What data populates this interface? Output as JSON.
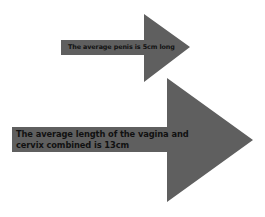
{
  "colors": {
    "background": "#ffffff",
    "arrow_fill": "#5f5f5f",
    "text": "#111111"
  },
  "arrows": [
    {
      "label": "The average penis is 5cm long",
      "direction": "right"
    },
    {
      "label": "The average length of the vagina and cervix combined is 13cm",
      "direction": "right"
    }
  ]
}
